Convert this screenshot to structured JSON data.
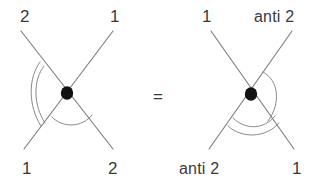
{
  "figure": {
    "kind": "particle-vertex-crossing-identity",
    "relation_symbol": "=",
    "background_color": "#ffffff",
    "line_color": "#7b7b7b",
    "arc_color": "#8a8a8a",
    "vertex_color": "#111111",
    "label_color": "#3a3a3a"
  },
  "left_diagram": {
    "name": "left-vertex-diagram",
    "vertex_label": "vertex-dot",
    "labels": {
      "top_left": "2",
      "top_right": "1",
      "bottom_left": "1",
      "bottom_right": "2"
    },
    "arcs": {
      "left_angle_count": 2,
      "bottom_angle_count": 1,
      "right_angle_count": 0,
      "top_angle_count": 0
    }
  },
  "right_diagram": {
    "name": "right-vertex-diagram",
    "vertex_label": "vertex-dot",
    "labels": {
      "top_left": "1",
      "top_right": "anti 2",
      "bottom_left": "anti 2",
      "bottom_right": "1"
    },
    "arcs": {
      "left_angle_count": 0,
      "bottom_angle_count": 2,
      "right_angle_count": 1,
      "top_angle_count": 0
    }
  }
}
